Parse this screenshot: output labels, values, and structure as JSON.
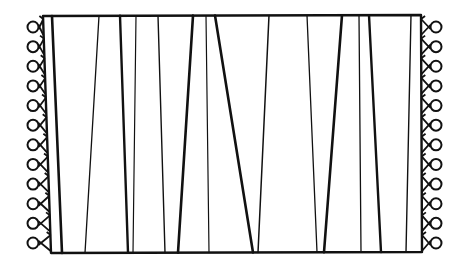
{
  "figure": {
    "stroke_color": "#111111",
    "background": "#ffffff",
    "border": {
      "top_left": [
        43,
        16
      ],
      "top_right": [
        421,
        15
      ],
      "bottom_right": [
        422,
        252
      ],
      "bottom_left": [
        51,
        253
      ]
    },
    "stripes": [
      {
        "top": 52,
        "bottom": 62,
        "weight": 2.6
      },
      {
        "top": 99,
        "bottom": 85,
        "weight": 1.3
      },
      {
        "top": 120,
        "bottom": 128,
        "weight": 2.4
      },
      {
        "top": 136,
        "bottom": 133,
        "weight": 1.2
      },
      {
        "top": 158,
        "bottom": 165,
        "weight": 1.4
      },
      {
        "top": 193,
        "bottom": 178,
        "weight": 2.6
      },
      {
        "top": 206,
        "bottom": 209,
        "weight": 1.2
      },
      {
        "top": 215,
        "bottom": 253,
        "weight": 2.6
      },
      {
        "top": 269,
        "bottom": 258,
        "weight": 1.5
      },
      {
        "top": 307,
        "bottom": 317,
        "weight": 1.3
      },
      {
        "top": 342,
        "bottom": 324,
        "weight": 2.6
      },
      {
        "top": 359,
        "bottom": 361,
        "weight": 1.3
      },
      {
        "top": 369,
        "bottom": 381,
        "weight": 2.4
      },
      {
        "top": 411,
        "bottom": 406,
        "weight": 1.4
      }
    ],
    "fringe": {
      "count_per_side": 12,
      "left_circle_x": 33,
      "right_circle_x": 436,
      "first_y": 27,
      "last_y": 243,
      "circle_radius": 5.5
    }
  }
}
